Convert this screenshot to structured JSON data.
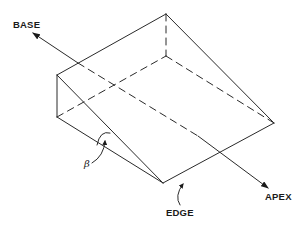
{
  "figure": {
    "type": "isometric prism / wedge diagram",
    "line_color": "#2a2a2a",
    "background": "#ffffff",
    "labels": {
      "base": "BASE",
      "apex": "APEX",
      "edge": "EDGE",
      "angle": "β"
    },
    "vertices": {
      "front_top_left": [
        57,
        75
      ],
      "front_bottom_left": [
        57,
        117
      ],
      "front_bottom_right": [
        163,
        183
      ],
      "back_top": [
        166,
        14
      ],
      "back_right": [
        274,
        123
      ],
      "back_hidden": [
        166,
        56
      ]
    },
    "axis_arrow": {
      "from_label": "BASE",
      "to_label": "APEX",
      "base_tip": [
        33,
        33
      ],
      "apex_tip": [
        268,
        188
      ]
    }
  }
}
